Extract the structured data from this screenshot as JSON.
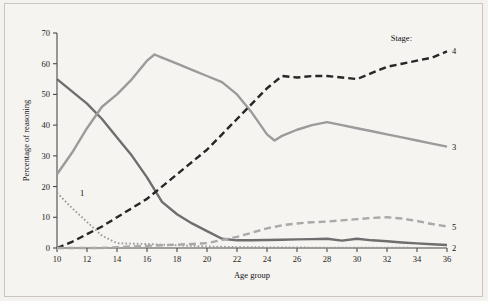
{
  "figure": {
    "background_color": "#f6f4f1",
    "frame_color": "#c9c6c1"
  },
  "chart_data": {
    "type": "line",
    "title": "",
    "xlabel": "Age group",
    "ylabel": "Percentage of reasoning",
    "xlim": [
      10,
      36
    ],
    "ylim": [
      0,
      70
    ],
    "xticks": [
      10,
      12,
      14,
      16,
      18,
      20,
      22,
      24,
      26,
      28,
      30,
      32,
      34,
      36
    ],
    "yticks": [
      0,
      10,
      20,
      30,
      40,
      50,
      60,
      70
    ],
    "grid": false,
    "legend_position": "line-end-labels",
    "legend_title": "Stage:",
    "series": [
      {
        "name": "1",
        "label": "1",
        "style": "dotted",
        "color": "#9a9a9a",
        "x": [
          10,
          11,
          12,
          13,
          14,
          15,
          16,
          17,
          18,
          19,
          20,
          21,
          22,
          23,
          24,
          25,
          26,
          27,
          28,
          29,
          30,
          31,
          32,
          33,
          34,
          35,
          36
        ],
        "values": [
          18,
          13,
          8.5,
          4,
          1.6,
          1.4,
          1.3,
          1.1,
          0.9,
          0.7,
          0.5,
          0.4,
          0.3,
          0.3,
          0.2,
          0.2,
          0.2,
          0.1,
          0.1,
          0.1,
          0.1,
          0.1,
          0.1,
          0.1,
          0,
          0,
          0
        ]
      },
      {
        "name": "2",
        "label": "2",
        "style": "solid",
        "color": "#6e6e6e",
        "x": [
          10,
          11,
          12,
          13,
          14,
          15,
          16,
          17,
          18,
          19,
          20,
          21,
          22,
          23,
          24,
          25,
          26,
          27,
          28,
          29,
          30,
          31,
          32,
          33,
          34,
          35,
          36
        ],
        "values": [
          55,
          51,
          47,
          42,
          36,
          30,
          23,
          15,
          11,
          8,
          5.5,
          3,
          2.5,
          2.5,
          2.6,
          2.7,
          2.8,
          2.9,
          3,
          2.4,
          3,
          2.5,
          2.2,
          1.8,
          1.5,
          1.2,
          1
        ]
      },
      {
        "name": "3",
        "label": "3",
        "style": "solid",
        "color": "#9b9b9b",
        "x": [
          10,
          11,
          12,
          13,
          14,
          15,
          16,
          16.5,
          17,
          18,
          19,
          20,
          21,
          22,
          23,
          24,
          24.5,
          25,
          26,
          27,
          28,
          29,
          30,
          31,
          32,
          33,
          34,
          35,
          36
        ],
        "values": [
          24,
          31,
          39,
          46,
          50,
          55,
          61,
          63,
          62,
          60,
          58,
          56,
          54,
          50,
          44,
          37,
          35,
          36.5,
          38.5,
          40,
          41,
          40,
          39,
          38,
          37,
          36,
          35,
          34,
          33
        ]
      },
      {
        "name": "4",
        "label": "4",
        "style": "dashed",
        "color": "#262626",
        "x": [
          10,
          11,
          12,
          13,
          14,
          15,
          16,
          17,
          18,
          19,
          20,
          21,
          22,
          23,
          24,
          25,
          26,
          27,
          28,
          29,
          30,
          31,
          32,
          33,
          34,
          35,
          36
        ],
        "values": [
          0,
          2,
          4.5,
          7,
          10,
          13,
          16,
          20,
          24,
          28,
          32,
          37,
          42,
          47,
          52,
          56,
          55.5,
          56,
          56,
          55.5,
          55,
          57,
          59,
          60,
          61,
          62,
          64
        ]
      },
      {
        "name": "5",
        "label": "5",
        "style": "dashed",
        "color": "#a9a9a9",
        "x": [
          10,
          11,
          12,
          13,
          14,
          15,
          16,
          17,
          18,
          19,
          20,
          21,
          22,
          23,
          24,
          25,
          26,
          27,
          28,
          29,
          30,
          31,
          32,
          33,
          34,
          35,
          36
        ],
        "values": [
          0,
          0,
          0,
          0,
          0.3,
          0.5,
          0.7,
          0.9,
          1.1,
          1.3,
          1.6,
          2.6,
          3.6,
          5,
          6.4,
          7.4,
          8,
          8.4,
          8.6,
          9,
          9.4,
          9.8,
          10,
          9.6,
          8.8,
          7.8,
          7
        ]
      }
    ]
  }
}
